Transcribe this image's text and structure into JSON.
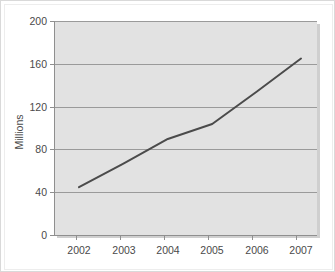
{
  "chart_data": {
    "type": "line",
    "title": "",
    "subtitle": "",
    "xlabel": "",
    "ylabel": "Millions",
    "categories": [
      "2002",
      "2003",
      "2004",
      "2005",
      "2006",
      "2007"
    ],
    "values": [
      45,
      67,
      90,
      104,
      134,
      165
    ],
    "series": [
      {
        "name": "Millions",
        "values": [
          45,
          67,
          90,
          104,
          134,
          165
        ],
        "color": "#4b4b4b"
      }
    ],
    "ylim": [
      0,
      200
    ],
    "yticks": [
      0,
      40,
      80,
      120,
      160,
      200
    ],
    "ytick_labels": [
      "0",
      "40",
      "80",
      "120",
      "160",
      "200"
    ],
    "xtick_labels": [
      "2002",
      "2003",
      "2004",
      "2005",
      "2006",
      "2007"
    ],
    "grid": true,
    "grid_axis": "y",
    "legend": false,
    "legend_position": "none",
    "annotations": [],
    "colors": {
      "plot_background": "#e2e2e2",
      "page_background": "#ffffff",
      "gridline": "#9a9a9a",
      "axis": "#8f8f8f",
      "line": "#4b4b4b",
      "text": "#4a4a4a",
      "frame_border": "#d9d9d9"
    }
  }
}
